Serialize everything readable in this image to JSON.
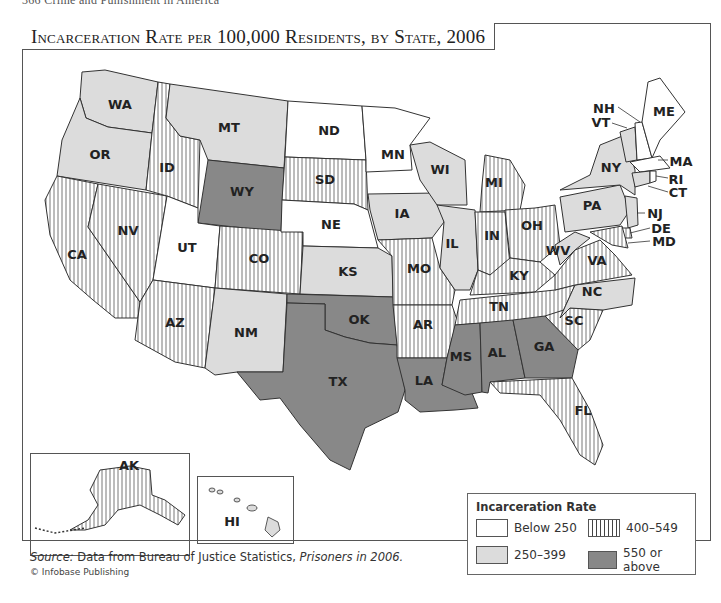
{
  "page": {
    "running_head": "366   Crime and Punishment in America"
  },
  "title": "Incarceration Rate per 100,000 Residents, by State, 2006",
  "legend": {
    "title": "Incarceration Rate",
    "items": [
      {
        "label": "Below 250",
        "style": "white",
        "color": "#ffffff"
      },
      {
        "label": "400–549",
        "style": "hatched",
        "color": "#444444"
      },
      {
        "label": "250–399",
        "style": "light-gray",
        "color": "#dcdcdc"
      },
      {
        "label": "550 or above",
        "style": "dark-gray",
        "color": "#888888"
      }
    ]
  },
  "source": {
    "prefix": "Source:",
    "text": " Data from Bureau of Justice Statistics, ",
    "publication": "Prisoners in 2006."
  },
  "copyright": "© Infobase Publishing",
  "categories": {
    "below_250": [
      "ND",
      "MN",
      "NE",
      "UT",
      "ME",
      "NH",
      "MA",
      "RI"
    ],
    "250_399": [
      "WA",
      "OR",
      "MT",
      "NM",
      "KS",
      "IA",
      "WI",
      "IL",
      "NY",
      "PA",
      "NJ",
      "WV",
      "NC",
      "VT",
      "CT",
      "HI"
    ],
    "400_549": [
      "CA",
      "NV",
      "ID",
      "AZ",
      "CO",
      "SD",
      "MO",
      "AR",
      "MI",
      "IN",
      "OH",
      "KY",
      "TN",
      "VA",
      "SC",
      "FL",
      "AK",
      "DE",
      "MD"
    ],
    "550_above": [
      "WY",
      "OK",
      "TX",
      "LA",
      "MS",
      "AL",
      "GA"
    ]
  },
  "states": {
    "WA": "WA",
    "OR": "OR",
    "CA": "CA",
    "NV": "NV",
    "ID": "ID",
    "MT": "MT",
    "WY": "WY",
    "UT": "UT",
    "AZ": "AZ",
    "CO": "CO",
    "NM": "NM",
    "ND": "ND",
    "SD": "SD",
    "NE": "NE",
    "KS": "KS",
    "OK": "OK",
    "TX": "TX",
    "MN": "MN",
    "IA": "IA",
    "MO": "MO",
    "AR": "AR",
    "LA": "LA",
    "WI": "WI",
    "IL": "IL",
    "MI": "MI",
    "IN": "IN",
    "OH": "OH",
    "KY": "KY",
    "TN": "TN",
    "MS": "MS",
    "AL": "AL",
    "GA": "GA",
    "FL": "FL",
    "SC": "SC",
    "NC": "NC",
    "VA": "VA",
    "WV": "WV",
    "PA": "PA",
    "NY": "NY",
    "NJ": "NJ",
    "DE": "DE",
    "MD": "MD",
    "CT": "CT",
    "RI": "RI",
    "MA": "MA",
    "VT": "VT",
    "NH": "NH",
    "ME": "ME",
    "AK": "AK",
    "HI": "HI"
  }
}
